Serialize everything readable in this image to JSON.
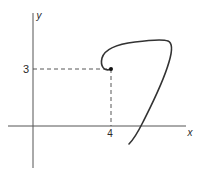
{
  "diagram": {
    "type": "parametric-curve-plot",
    "axes": {
      "x_label": "x",
      "y_label": "y"
    },
    "marked_point": {
      "x": 4,
      "y": 3,
      "x_tick_label": "4",
      "y_tick_label": "3"
    },
    "colors": {
      "axis": "#555555",
      "curve": "#333333",
      "guide": "#444444",
      "point": "#111111"
    }
  }
}
